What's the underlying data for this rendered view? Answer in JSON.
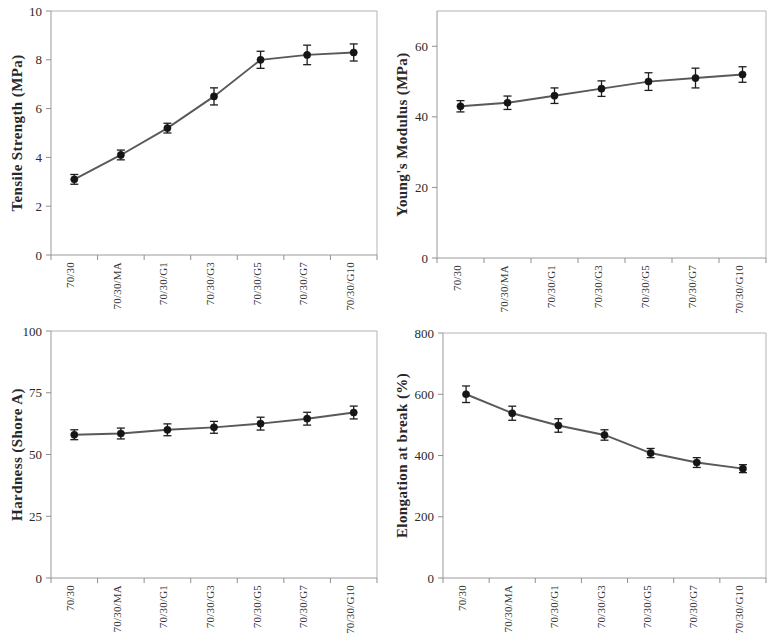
{
  "figure": {
    "panel_count": 4,
    "categories": [
      "70/30",
      "70/30/MA",
      "70/30/G1",
      "70/30/G3",
      "70/30/G5",
      "70/30/G7",
      "70/30/G10"
    ],
    "series_color": "#595959",
    "marker_color": "#151515",
    "axis_color": "#9a9a9a"
  },
  "chart_data": [
    {
      "type": "line",
      "title": "",
      "panel": "top-left",
      "xlabel": "",
      "ylabel": "Tensile Strength  (MPa)",
      "categories": [
        "70/30",
        "70/30/MA",
        "70/30/G1",
        "70/30/G3",
        "70/30/G5",
        "70/30/G7",
        "70/30/G10"
      ],
      "values": [
        3.1,
        4.1,
        5.2,
        6.5,
        8.0,
        8.2,
        8.3
      ],
      "errors": [
        0.2,
        0.2,
        0.2,
        0.35,
        0.35,
        0.4,
        0.35
      ],
      "ylim": [
        0,
        10
      ],
      "yticks": [
        0,
        2,
        4,
        6,
        8,
        10
      ],
      "ytick_labels": [
        "0",
        "2",
        "4",
        "6",
        "8",
        "10"
      ],
      "grid": false,
      "legend": "none"
    },
    {
      "type": "line",
      "title": "",
      "panel": "top-right",
      "xlabel": "",
      "ylabel": "Young's Modulus  (MPa)",
      "categories": [
        "70/30",
        "70/30/MA",
        "70/30/G1",
        "70/30/G3",
        "70/30/G5",
        "70/30/G7",
        "70/30/G10"
      ],
      "values": [
        43,
        44,
        46,
        48,
        50,
        51,
        52
      ],
      "errors": [
        1.6,
        1.9,
        2.2,
        2.2,
        2.5,
        2.8,
        2.2
      ],
      "ylim": [
        0,
        70
      ],
      "yticks": [
        0,
        20,
        40,
        60
      ],
      "ytick_labels": [
        "0",
        "20",
        "40",
        "60"
      ],
      "grid": false,
      "legend": "none"
    },
    {
      "type": "line",
      "title": "",
      "panel": "bottom-left",
      "xlabel": "",
      "ylabel": "Hardness (Shore A)",
      "categories": [
        "70/30",
        "70/30/MA",
        "70/30/G1",
        "70/30/G3",
        "70/30/G5",
        "70/30/G7",
        "70/30/G10"
      ],
      "values": [
        58,
        58.5,
        60,
        61,
        62.5,
        64.5,
        67
      ],
      "errors": [
        2.0,
        2.2,
        2.4,
        2.4,
        2.6,
        2.6,
        2.6
      ],
      "ylim": [
        0,
        100
      ],
      "yticks": [
        0,
        25,
        50,
        75,
        100
      ],
      "ytick_labels": [
        "0",
        "25",
        "50",
        "75",
        "100"
      ],
      "grid": false,
      "legend": "none"
    },
    {
      "type": "line",
      "title": "",
      "panel": "bottom-right",
      "xlabel": "",
      "ylabel": "Elongation at break (%)",
      "categories": [
        "70/30",
        "70/30/MA",
        "70/30/G1",
        "70/30/G3",
        "70/30/G5",
        "70/30/G7",
        "70/30/G10"
      ],
      "values": [
        600,
        538,
        498,
        467,
        408,
        377,
        357
      ],
      "errors": [
        27,
        23,
        22,
        17,
        15,
        16,
        13
      ],
      "ylim": [
        0,
        800
      ],
      "yticks": [
        0,
        200,
        400,
        600,
        800
      ],
      "ytick_labels": [
        "0",
        "200",
        "400",
        "600",
        "800"
      ],
      "grid": false,
      "legend": "none"
    }
  ]
}
